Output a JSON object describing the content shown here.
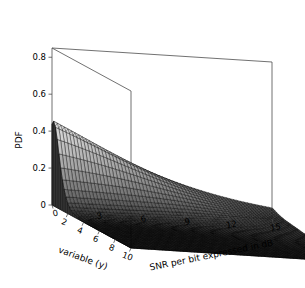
{
  "chart_data": {
    "type": "surface",
    "title": "",
    "xlabel": "variable (y)",
    "ylabel": "SNR per bit expressed in dB",
    "zlabel": "PDF",
    "x": [
      0,
      1,
      2,
      3,
      4,
      5,
      6,
      7,
      8,
      9,
      10
    ],
    "y": [
      0,
      1,
      2,
      3,
      4,
      5,
      6,
      7,
      8,
      9,
      10,
      11,
      12,
      13,
      14,
      15
    ],
    "xlim": [
      0,
      10
    ],
    "ylim": [
      0,
      15
    ],
    "zlim": [
      0,
      0.85
    ],
    "x_ticks": [
      2,
      4,
      6,
      8,
      10
    ],
    "x_tick_labels": [
      "2",
      "4",
      "6",
      "8",
      "10"
    ],
    "y_ticks": [
      0,
      3,
      6,
      9,
      12,
      15
    ],
    "y_tick_labels": [
      "0",
      "3",
      "6",
      "9",
      "12",
      "15"
    ],
    "z_ticks": [
      0,
      0.2,
      0.4,
      0.6,
      0.8
    ],
    "z_tick_labels": [
      "0",
      "0.2",
      "0.4",
      "0.6",
      "0.8"
    ],
    "grid": false,
    "legend": null,
    "mesh_color": "#000000",
    "frame_color": "#4d4d4d",
    "peak_value": 0.82,
    "peak_location": {
      "x": 0,
      "y": 0
    },
    "series": [
      {
        "name": "SNR = 0 dB",
        "z": [
          0.82,
          0.52,
          0.3,
          0.17,
          0.095,
          0.052,
          0.028,
          0.015,
          0.008,
          0.004,
          0.002
        ]
      },
      {
        "name": "SNR = 1 dB",
        "z": [
          0.75,
          0.49,
          0.29,
          0.17,
          0.094,
          0.052,
          0.028,
          0.015,
          0.008,
          0.004,
          0.002
        ]
      },
      {
        "name": "SNR = 2 dB",
        "z": [
          0.67,
          0.46,
          0.28,
          0.165,
          0.092,
          0.051,
          0.028,
          0.015,
          0.008,
          0.004,
          0.002
        ]
      },
      {
        "name": "SNR = 3 dB",
        "z": [
          0.59,
          0.43,
          0.27,
          0.16,
          0.09,
          0.05,
          0.027,
          0.015,
          0.008,
          0.004,
          0.002
        ]
      },
      {
        "name": "SNR = 4 dB",
        "z": [
          0.51,
          0.39,
          0.255,
          0.152,
          0.086,
          0.048,
          0.026,
          0.014,
          0.008,
          0.004,
          0.002
        ]
      },
      {
        "name": "SNR = 5 dB",
        "z": [
          0.44,
          0.35,
          0.235,
          0.143,
          0.082,
          0.046,
          0.025,
          0.014,
          0.007,
          0.004,
          0.002
        ]
      },
      {
        "name": "SNR = 6 dB",
        "z": [
          0.37,
          0.31,
          0.215,
          0.133,
          0.077,
          0.043,
          0.024,
          0.013,
          0.007,
          0.004,
          0.002
        ]
      },
      {
        "name": "SNR = 7 dB",
        "z": [
          0.31,
          0.27,
          0.193,
          0.122,
          0.071,
          0.04,
          0.022,
          0.012,
          0.007,
          0.003,
          0.002
        ]
      },
      {
        "name": "SNR = 8 dB",
        "z": [
          0.26,
          0.235,
          0.172,
          0.111,
          0.065,
          0.037,
          0.021,
          0.011,
          0.006,
          0.003,
          0.002
        ]
      },
      {
        "name": "SNR = 9 dB",
        "z": [
          0.215,
          0.2,
          0.151,
          0.099,
          0.059,
          0.034,
          0.019,
          0.01,
          0.006,
          0.003,
          0.002
        ]
      },
      {
        "name": "SNR = 10 dB",
        "z": [
          0.176,
          0.169,
          0.131,
          0.088,
          0.053,
          0.031,
          0.017,
          0.01,
          0.005,
          0.003,
          0.002
        ]
      },
      {
        "name": "SNR = 11 dB",
        "z": [
          0.143,
          0.141,
          0.112,
          0.077,
          0.047,
          0.028,
          0.016,
          0.009,
          0.005,
          0.003,
          0.001
        ]
      },
      {
        "name": "SNR = 12 dB",
        "z": [
          0.115,
          0.116,
          0.095,
          0.067,
          0.042,
          0.025,
          0.014,
          0.008,
          0.004,
          0.002,
          0.001
        ]
      },
      {
        "name": "SNR = 13 dB",
        "z": [
          0.092,
          0.094,
          0.079,
          0.057,
          0.036,
          0.022,
          0.013,
          0.007,
          0.004,
          0.002,
          0.001
        ]
      },
      {
        "name": "SNR = 14 dB",
        "z": [
          0.073,
          0.076,
          0.065,
          0.048,
          0.031,
          0.019,
          0.011,
          0.006,
          0.004,
          0.002,
          0.001
        ]
      },
      {
        "name": "SNR = 15 dB",
        "z": [
          0.057,
          0.061,
          0.053,
          0.04,
          0.027,
          0.017,
          0.01,
          0.006,
          0.003,
          0.002,
          0.001
        ]
      }
    ]
  },
  "axes": {
    "z_label": "PDF",
    "x_label": "variable (y)",
    "y_label": "SNR per bit expressed in dB",
    "z_ticks": [
      "0.8",
      "0.6",
      "0.4",
      "0.2",
      "0"
    ],
    "x_ticks": [
      "2",
      "4",
      "6",
      "8",
      "10"
    ],
    "y_ticks": [
      "0",
      "3",
      "6",
      "9",
      "12",
      "15"
    ]
  }
}
